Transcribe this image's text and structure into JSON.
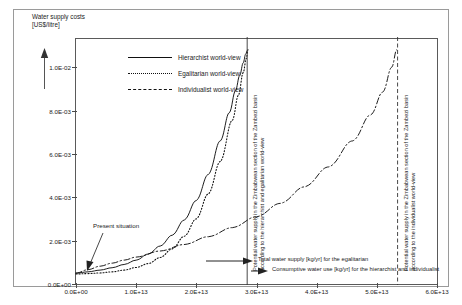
{
  "chart_data": {
    "type": "line",
    "title": "",
    "ylabel": "Water supply costs\n[US$/litre]",
    "xlabel": "",
    "xlim": [
      0,
      60000000000000.0
    ],
    "ylim": [
      0,
      0.0113
    ],
    "grid": false,
    "legend_position": "top-left",
    "xticks": [
      "0.0E+00",
      "1.0E+13",
      "2.0E+13",
      "3.0E+13",
      "4.0E+13",
      "5.0E+13",
      "6.0E+13"
    ],
    "xtick_values": [
      0,
      10000000000000.0,
      20000000000000.0,
      30000000000000.0,
      40000000000000.0,
      50000000000000.0,
      60000000000000.0
    ],
    "yticks": [
      "0.0E+00",
      "2.0E-03",
      "4.0E-03",
      "6.0E-03",
      "8.0E-03",
      "1.0E-02"
    ],
    "ytick_values": [
      0,
      0.002,
      0.004,
      0.006,
      0.008,
      0.01
    ],
    "series": [
      {
        "name": "Hierarchist world-view",
        "style": "solid",
        "x": [
          0,
          2000000000000.0,
          4000000000000.0,
          6000000000000.0,
          8000000000000.0,
          10000000000000.0,
          12000000000000.0,
          14000000000000.0,
          16000000000000.0,
          18000000000000.0,
          20000000000000.0,
          22000000000000.0,
          24000000000000.0,
          25500000000000.0,
          26500000000000.0,
          27200000000000.0,
          27800000000000.0,
          28200000000000.0,
          28500000000000.0
        ],
        "values": [
          0.0005,
          0.00056,
          0.00064,
          0.00075,
          0.0009,
          0.0011,
          0.00138,
          0.00175,
          0.00225,
          0.00295,
          0.00385,
          0.00505,
          0.0066,
          0.0079,
          0.0089,
          0.0096,
          0.0102,
          0.0106,
          0.0108
        ]
      },
      {
        "name": "Egalitarian world-view",
        "style": "dotted",
        "x": [
          0,
          2000000000000.0,
          4000000000000.0,
          6000000000000.0,
          8000000000000.0,
          10000000000000.0,
          12000000000000.0,
          14000000000000.0,
          16000000000000.0,
          18000000000000.0,
          20000000000000.0,
          22000000000000.0,
          24000000000000.0,
          26000000000000.0,
          27000000000000.0,
          27800000000000.0,
          28300000000000.0,
          28600000000000.0
        ],
        "values": [
          0.00046,
          0.00048,
          0.00051,
          0.00056,
          0.00064,
          0.00076,
          0.00094,
          0.00122,
          0.00162,
          0.0022,
          0.003,
          0.00415,
          0.00565,
          0.00755,
          0.0087,
          0.00975,
          0.0104,
          0.0108
        ]
      },
      {
        "name": "Individualist world-view",
        "style": "dashdot",
        "x": [
          0,
          2000000000000.0,
          4000000000000.0,
          6000000000000.0,
          8000000000000.0,
          10000000000000.0,
          14000000000000.0,
          18000000000000.0,
          22000000000000.0,
          26000000000000.0,
          30000000000000.0,
          34000000000000.0,
          38000000000000.0,
          42000000000000.0,
          46000000000000.0,
          49000000000000.0,
          51000000000000.0,
          52500000000000.0,
          53300000000000.0
        ],
        "values": [
          0.0005,
          0.00066,
          0.00082,
          0.00096,
          0.0011,
          0.00124,
          0.00152,
          0.00182,
          0.00218,
          0.0026,
          0.0031,
          0.00372,
          0.00448,
          0.0054,
          0.0066,
          0.0078,
          0.00885,
          0.01,
          0.0108
        ]
      }
    ],
    "vertical_lines": [
      {
        "name": "hierarchist-egalitarian-supply-line",
        "x": 28450000000000.0,
        "style": "solid",
        "label": "Potential water supply in the Zimbabwean section of the Zambezi basin\naccording to the hierarchist and egalitarian world-view"
      },
      {
        "name": "individualist-supply-line",
        "x": 53450000000000.0,
        "style": "dashed",
        "label": "Potential water supply in the Zimbabwean section of the Zambezi basin\naccording to the individualist world-view"
      }
    ],
    "annotations": [
      {
        "name": "present-situation",
        "text": "Present situation",
        "x": 1000000000000.0,
        "y": 0.0005
      },
      {
        "name": "total-water-supply-note",
        "text": "Total water supply [kg/yr] for the egalitarian"
      },
      {
        "name": "consumptive-water-use-note",
        "text": "Consumptive water use [kg/yr]  for the hierarchist and individualist"
      }
    ]
  },
  "legend": {
    "items": [
      {
        "label": "Hierarchist world-view",
        "style": "solid"
      },
      {
        "label": "Egalitarian world-view",
        "style": "dotted"
      },
      {
        "label": "Individualist world-view",
        "style": "dashdot"
      }
    ]
  },
  "axis": {
    "y_title_line1": "Water supply costs",
    "y_title_line2": "[US$/litre]"
  },
  "vlabels": {
    "left_line1": "Potential water supply in the Zimbabwean section of the Zambezi basin",
    "left_line2": "according to the hierarchist and egalitarian world-view",
    "right_line1": "Potential water supply in the Zimbabwean section of the Zambezi basin",
    "right_line2": "according to the individualist world-view"
  },
  "notes": {
    "present": "Present situation",
    "total_supply": "Total water supply [kg/yr] for the egalitarian",
    "consumptive": "Consumptive water use [kg/yr]  for the hierarchist and individualist"
  },
  "colors": {
    "ink": "#1a1a1a",
    "frame": "#5a5a5a",
    "outer": "#9a9a9a"
  }
}
